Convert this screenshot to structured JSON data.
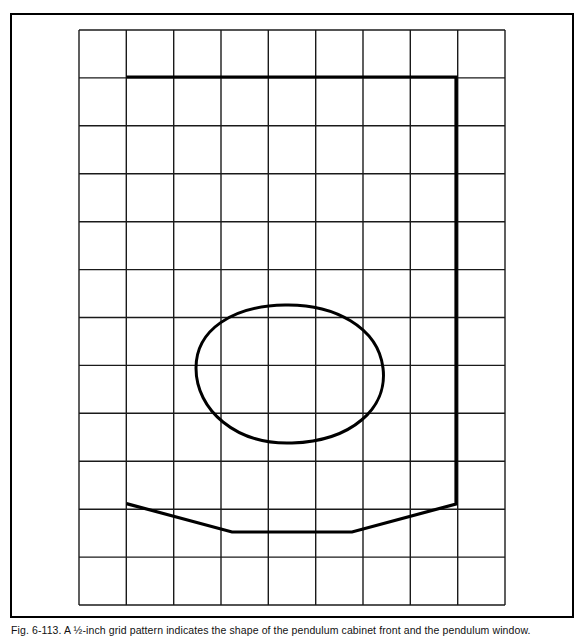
{
  "figure": {
    "id": "fig-6-113",
    "caption": "Fig. 6-113. A ½-inch grid pattern indicates the shape of the pendulum cabinet front and the pendulum window.",
    "caption_label": "Fig. 6-113.",
    "caption_text": "A ½-inch grid pattern indicates the shape of the pendulum cabinet front and the pendulum window.",
    "grid_unit_label": "½-inch"
  },
  "colors": {
    "ink": "#000000",
    "paper": "#ffffff",
    "grid_line": "#1a1a1a",
    "outline": "#000000",
    "border": "#000000"
  },
  "strokes": {
    "outer_border_width": 2.0,
    "grid_width": 1.4,
    "cabinet_outline_width": 3.2,
    "window_outline_width": 3.0
  },
  "outer_border": {
    "x": 11,
    "y": 14,
    "width": 562,
    "height": 603
  },
  "grid": {
    "x0": 79,
    "y0": 30,
    "x1": 505,
    "y1": 605,
    "columns": 9,
    "rows": 12,
    "cell_width": 47.33,
    "cell_height": 47.92,
    "x_lines": [
      79,
      126.3,
      173.7,
      221.0,
      268.3,
      315.7,
      363.0,
      410.3,
      457.7,
      505
    ],
    "y_lines": [
      30,
      77.9,
      125.8,
      173.8,
      221.7,
      269.6,
      317.5,
      365.4,
      413.3,
      461.3,
      509.2,
      557.1,
      605
    ]
  },
  "cabinet_front": {
    "name": "pendulum-cabinet-front-outline",
    "points": [
      [
        128,
        77
      ],
      [
        456,
        77
      ],
      [
        456,
        504
      ],
      [
        352,
        532
      ],
      [
        232,
        532
      ],
      [
        128,
        504
      ]
    ],
    "closed": false,
    "description": "Open-topped cabinet front profile: vertical sides, flat top, tapered bottom apron"
  },
  "pendulum_window": {
    "name": "pendulum-window-outline",
    "center": [
      290,
      374
    ],
    "extents": {
      "left": 196,
      "right": 384,
      "top": 305,
      "bottom": 443
    },
    "width": 188,
    "height": 138,
    "path": "M 196,368 C 196,330 232,306 285,305 C 334,304 378,327 383,368 C 388,408 352,441 292,443 C 236,445 196,410 196,368 Z",
    "description": "Irregular egg/oval shaped pendulum window"
  }
}
